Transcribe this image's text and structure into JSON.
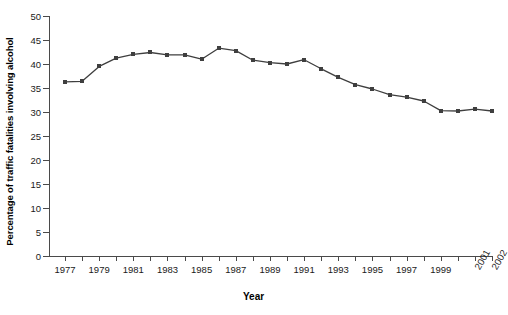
{
  "chart_data": {
    "type": "line",
    "title": "",
    "xlabel": "Year",
    "ylabel": "Percentage of traffic fatalities involving alcohol",
    "x": [
      1977,
      1978,
      1979,
      1980,
      1981,
      1982,
      1983,
      1984,
      1985,
      1986,
      1987,
      1988,
      1989,
      1990,
      1991,
      1992,
      1993,
      1994,
      1995,
      1996,
      1997,
      1998,
      1999,
      2000,
      2001,
      2002
    ],
    "values": [
      36.3,
      36.4,
      39.5,
      41.2,
      42.0,
      42.4,
      41.9,
      41.9,
      41.0,
      43.3,
      42.8,
      40.8,
      40.3,
      40.0,
      40.9,
      39.0,
      37.2,
      35.7,
      34.8,
      33.6,
      33.1,
      32.3,
      30.3,
      30.2,
      30.6,
      30.2
    ],
    "categories": [
      "1977",
      "1978",
      "1979",
      "1980",
      "1981",
      "1982",
      "1983",
      "1984",
      "1985",
      "1986",
      "1987",
      "1988",
      "1989",
      "1990",
      "1991",
      "1992",
      "1993",
      "1994",
      "1995",
      "1996",
      "1997",
      "1998",
      "1999",
      "2000",
      "2001",
      "2002"
    ],
    "tick_labels_visible": [
      "1977",
      "1979",
      "1981",
      "1983",
      "1985",
      "1987",
      "1989",
      "1991",
      "1993",
      "1995",
      "1997",
      "1999",
      "2001",
      "2002"
    ],
    "ytick_labels": [
      "0",
      "5",
      "10",
      "15",
      "20",
      "25",
      "30",
      "35",
      "40",
      "45",
      "50"
    ],
    "ylim": [
      0,
      50
    ],
    "xlim": [
      1977,
      2002
    ],
    "ystep": 5,
    "grid": false,
    "legend": null,
    "series_color": "#3f3f3f",
    "axis_color": "#4a4a4a"
  }
}
